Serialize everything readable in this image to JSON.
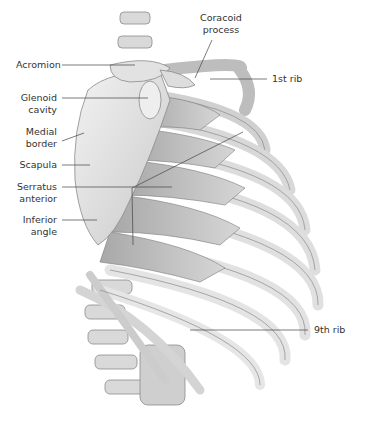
{
  "figure": {
    "colors": {
      "background": "#ffffff",
      "bone": "#e6e6e6",
      "bone_shadow": "#9a9a9a",
      "muscle": "#bdbdbd",
      "leader": "#444444",
      "text": "#333333"
    }
  },
  "labels": {
    "coracoid": {
      "line1": "Coracoid",
      "line2": "process"
    },
    "acromion": "Acromion",
    "first_rib": "1st rib",
    "glenoid": {
      "line1": "Glenoid",
      "line2": "cavity"
    },
    "medial": {
      "line1": "Medial",
      "line2": "border"
    },
    "scapula": "Scapula",
    "serratus": {
      "line1": "Serratus",
      "line2": "anterior"
    },
    "inferior": {
      "line1": "Inferior",
      "line2": "angle"
    },
    "ninth_rib": "9th rib"
  }
}
